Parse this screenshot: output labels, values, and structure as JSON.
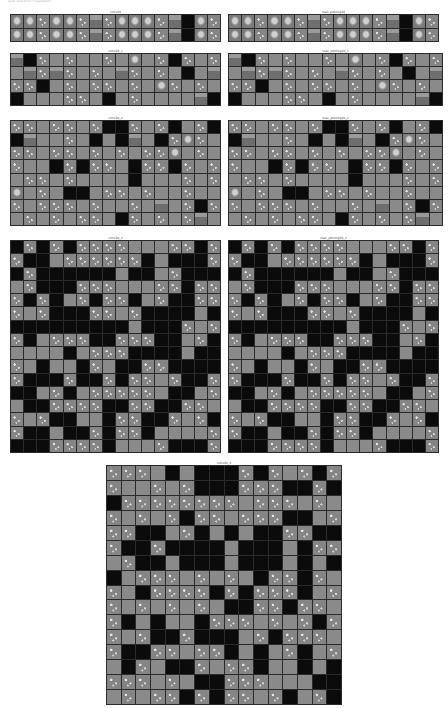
{
  "figure": {
    "header_text": "layer activation visualization",
    "background": "#ffffff",
    "colors": {
      "dead": "#0b0b0b",
      "flat": "#8a8a8a",
      "textured": "#858585",
      "gridline": "#2b2b2b"
    }
  },
  "panels": [
    {
      "id": "conv2d",
      "title": "conv2d",
      "cols": 16,
      "rows": 2,
      "box": {
        "left": 10,
        "top": 10,
        "width": 211,
        "height": 32
      },
      "cells": "iitiitdtiiitdkit"
    },
    {
      "id": "max_pooling2d",
      "title": "max_pooling2d",
      "cols": 16,
      "rows": 2,
      "box": {
        "left": 228,
        "top": 10,
        "width": 211,
        "height": 32
      },
      "cells": "iitiitdtiiitdkit"
    },
    {
      "id": "conv2d_1",
      "title": "conv2d_1",
      "cols": 16,
      "rows": 4,
      "box": {
        "left": 10,
        "top": 49,
        "width": 211,
        "height": 57
      },
      "cells": "dktgtggtgigtktgtgdtdtgtgdtgtgkgdttkgtgttgtgitgtgkgggttgkgtgggg"
    },
    {
      "id": "max_pooling2d_1",
      "title": "max_pooling2d_1",
      "cols": 16,
      "rows": 4,
      "box": {
        "left": 228,
        "top": 49,
        "width": 215,
        "height": 57
      },
      "cells": "dktgtggtgigtktgtgdtdtgtgdtgtgkgdttkgtgttgtgitgtgkgggttgkgtgggg"
    },
    {
      "id": "conv2d_2",
      "title": "conv2d_2",
      "cols": 16,
      "rows": 8,
      "box": {
        "left": 10,
        "top": 116,
        "width": 211,
        "height": 110
      },
      "cells": "ttgttgtkktgtkgtkkdggtgkgkdgktitgttgttgtgtgttigtgtggktkttgkttktgtgttgtggggkgggtgtigtgkkgttgtggtggtgtttgtggtgdgtktgtgtgttgktgtgtdgtgggtkkkgtggkt"
    },
    {
      "id": "max_pooling2d_2",
      "title": "max_pooling2d_2",
      "cols": 16,
      "rows": 8,
      "box": {
        "left": 228,
        "top": 116,
        "width": 215,
        "height": 110
      },
      "cells": "ttgttgtkktgtkgtkkdggtgkgkdgktitgttgttgtgtgttigtgtggktkttgkttktgtgttgtggggkgggtgtigtgkkgttgtggtggtgtttgtggtgdgtktgtgtgttgktgtgtdgtgggtkkkgtggkt"
    },
    {
      "id": "conv2d_3",
      "title": "conv2d_3",
      "cols": 16,
      "rows": 16,
      "box": {
        "left": 10,
        "top": 236,
        "width": 211,
        "height": 217
      },
      "cells": "ktktkttttgggttkttkkgttttttkgkkktktkkkkkkgkkgtkkkgtkkktttgggttktttktkgtkttkgtkktttgtkkkttgtkkkkgkkkkkkkkkkgkkktgttkgtttkktttkkgtkggggkgtttkkkkgkktgkggktgkkttkkkktkkktkktkttgtkktkkgtkgtttttgkkgtgkkttttkkttkkttgtgtkkggkttkktgtktkkgkktkttkggggtkkkttttkgggtkkktkkgtgkkgggtkttkgkkgkkkkgkkkkkgggkkkkktkkkkkgkgtgtkgktkkkkktkk"
    },
    {
      "id": "max_pooling2d_3",
      "title": "max_pooling2d_3",
      "cols": 16,
      "rows": 16,
      "box": {
        "left": 228,
        "top": 236,
        "width": 211,
        "height": 217
      },
      "cells": "ktktkttttgggttkttkkgttttttkgkkktktkkkkkkgkkgtkkkgtkkktttgggttktttktkgtkttkgtkktttgtkkkttgtkkkkgkkkkkkkkkkgkkktgttkgtttkktttkkgtkggggkgtttkkkkgkktgkggktgkkttkkkktkkktkktkttgtkktkkgtkgtttttgkkgtgkkttttkkttkkttgtgtkkggkttkktgtktkkgkktkttkggggtkkkttttkgggtkkktkkgtgkkgggtkttkgkkgkkkkgkkkkkgggkkkkktkkkkkgkgtgtkgktkkkkktkk"
    },
    {
      "id": "conv2d_4",
      "title": "conv2d_4",
      "cols": 16,
      "rows": 16,
      "box": {
        "left": 106,
        "top": 461,
        "width": 236,
        "height": 244
      },
      "cells": "tttgkgkkktktgtkttggtgtkkktttkktkkttttttttgtttgtgtgtgtkttgtttkkgtttkkgtkgkgkkttkktkktkkkkgkkkgkttgtkkgkkkgkkkgkgkkgtttgtgtgkttktgtgkttttktktttkgttgtgtgtgkkttkttgtkgkggktttgtgtkttgtkktkkkgtktttgtkkttgttkgkgtkgtgktgkktgttkggkgktttgtgkktttgggkkgtgttktkttgtkgtkgkttkkggtgktkkgttgttgkgktkttkkgkkkgtkgtkttttgkkgttt"
    }
  ]
}
